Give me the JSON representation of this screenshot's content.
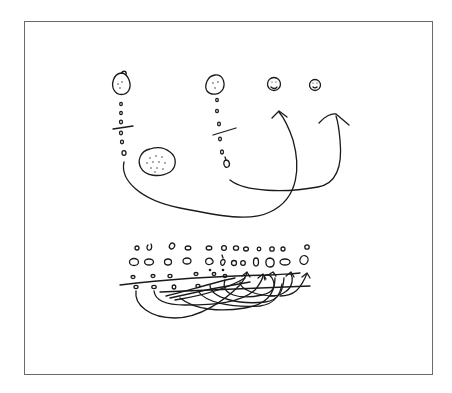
{
  "diagram": {
    "type": "hand-drawn sketch",
    "ink_color": "#1a1a1a",
    "frame_color": "#6a6a6a",
    "background": "#ffffff",
    "top_section": {
      "left_group": {
        "head_node": "egg-shaped circle with face dots",
        "chain": "vertical chain of small beads, divided by a short tick line",
        "side_blob": "large round blob filled with dots"
      },
      "middle_group": {
        "head_node": "oval circle with face dots",
        "chain": "vertical chain of small beads, divided by a short tick line"
      },
      "targets": [
        "small face circle",
        "small face circle"
      ],
      "arrows": [
        "from bottom of left chain, curving down and right, up to first target",
        "from bottom of middle chain, curving right, up to second target"
      ]
    },
    "bottom_section": {
      "rows": [
        "row of small beads",
        "row of larger shaded beads",
        "row of beads on a horizontal line",
        "row of beads below the line"
      ],
      "arrows": "many tangled looping arrows from lower beads up to beads on the right"
    }
  }
}
